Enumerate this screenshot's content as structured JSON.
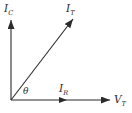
{
  "diagram": {
    "kind": "phasor-diagram",
    "background_color": "#ffffff",
    "line_color": "#2b2b2b",
    "labels": {
      "ic": {
        "main": "I",
        "sub": "C"
      },
      "it": {
        "main": "I",
        "sub": "T"
      },
      "ir": {
        "main": "I",
        "sub": "R"
      },
      "vt": {
        "main": "V",
        "sub": "T"
      },
      "theta": "θ"
    },
    "vectors": [
      {
        "name": "I_C",
        "direction": "up",
        "from_origin": true
      },
      {
        "name": "I_T",
        "direction": "diagonal-up-right",
        "angle_from_horizontal_deg": 52,
        "from_origin": true
      },
      {
        "name": "I_R",
        "direction": "right",
        "length": "short",
        "from_origin": true
      },
      {
        "name": "V_T",
        "direction": "right",
        "length": "long",
        "role": "reference-axis"
      }
    ],
    "angle": {
      "symbol": "θ",
      "between": [
        "I_R",
        "I_T"
      ]
    }
  }
}
